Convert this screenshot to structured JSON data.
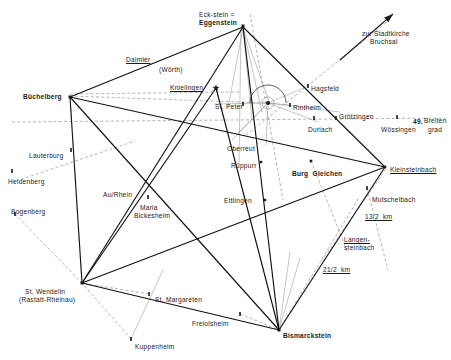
{
  "figure": {
    "kind": "geometric-survey-map",
    "region": "Karlsruhe / Rastatt / Pfinzgau alignment diagram",
    "colors": {
      "ink": "#1a1a1a",
      "heavy_line": "#111111",
      "light_line": "#8a8a8a",
      "dashed_line": "#777777",
      "background": "#ffffff"
    }
  },
  "labels": [
    {
      "id": "eckstein",
      "text": "Eck-stein =",
      "x": 199,
      "y": 11,
      "bold": false,
      "underline": false,
      "align": "left"
    },
    {
      "id": "eggenstein",
      "text": "Eggenstein",
      "x": 199,
      "y": 19,
      "bold": true,
      "underline": false,
      "align": "left"
    },
    {
      "id": "stadtkirche",
      "text": "zur Stadtkirche",
      "x": 362,
      "y": 30,
      "bold": false,
      "underline": false,
      "align": "left"
    },
    {
      "id": "bruchsal",
      "text": "Bruchsal",
      "x": 370,
      "y": 38,
      "bold": false,
      "underline": false,
      "align": "left"
    },
    {
      "id": "daimler",
      "text": "Daimler",
      "x": 126,
      "y": 56,
      "bold": false,
      "underline": true,
      "align": "left"
    },
    {
      "id": "woerth",
      "text": "(Wörth)",
      "x": 159,
      "y": 66,
      "bold": false,
      "underline": false,
      "align": "left"
    },
    {
      "id": "knielingen",
      "text": "Knielingen",
      "x": 170,
      "y": 84,
      "bold": false,
      "underline": true,
      "align": "left"
    },
    {
      "id": "hagsfeld",
      "text": "Hagsfeld",
      "x": 311,
      "y": 85,
      "bold": false,
      "underline": false,
      "align": "left"
    },
    {
      "id": "buechelberg",
      "text": "Büchelberg",
      "x": 23,
      "y": 93,
      "bold": true,
      "underline": false,
      "align": "left"
    },
    {
      "id": "stpeter",
      "text": "St. Peter",
      "x": 215,
      "y": 103,
      "bold": false,
      "underline": false,
      "align": "left"
    },
    {
      "id": "rintheim",
      "text": "Rintheim",
      "x": 293,
      "y": 104,
      "bold": false,
      "underline": false,
      "align": "left"
    },
    {
      "id": "groetzingen",
      "text": "Grötzingen",
      "x": 339,
      "y": 113,
      "bold": false,
      "underline": false,
      "align": "left"
    },
    {
      "id": "breitengrad_num",
      "text": "49.",
      "x": 413,
      "y": 118,
      "bold": true,
      "underline": false,
      "align": "left"
    },
    {
      "id": "breiten",
      "text": "Breiten",
      "x": 424,
      "y": 117,
      "bold": false,
      "underline": false,
      "align": "left"
    },
    {
      "id": "grad",
      "text": "grad",
      "x": 428,
      "y": 126,
      "bold": false,
      "underline": false,
      "align": "left"
    },
    {
      "id": "durlach",
      "text": "Durlach",
      "x": 308,
      "y": 126,
      "bold": false,
      "underline": false,
      "align": "left"
    },
    {
      "id": "woessingen",
      "text": "Wössingen",
      "x": 381,
      "y": 126,
      "bold": false,
      "underline": false,
      "align": "left"
    },
    {
      "id": "lauterburg",
      "text": "Lauterburg",
      "x": 29,
      "y": 152,
      "bold": false,
      "underline": false,
      "align": "left"
    },
    {
      "id": "oberreut",
      "text": "Oberreut",
      "x": 227,
      "y": 145,
      "bold": false,
      "underline": false,
      "align": "left"
    },
    {
      "id": "rueppurr",
      "text": "Rüppurr",
      "x": 231,
      "y": 162,
      "bold": false,
      "underline": false,
      "align": "left"
    },
    {
      "id": "burg_gleichen",
      "text": "Burg  Gleichen",
      "x": 292,
      "y": 170,
      "bold": true,
      "underline": false,
      "align": "left"
    },
    {
      "id": "kleinsteinbach",
      "text": "Kleinsteinbach",
      "x": 390,
      "y": 166,
      "bold": false,
      "underline": true,
      "align": "left"
    },
    {
      "id": "heidenberg",
      "text": "Heidenberg",
      "x": 8,
      "y": 178,
      "bold": false,
      "underline": false,
      "align": "left"
    },
    {
      "id": "au_rhein",
      "text": "Au/Rhein",
      "x": 103,
      "y": 191,
      "bold": false,
      "underline": false,
      "align": "left"
    },
    {
      "id": "mutschelbach",
      "text": "Mutschelbach",
      "x": 372,
      "y": 196,
      "bold": false,
      "underline": false,
      "align": "left"
    },
    {
      "id": "bogenberg",
      "text": "Bogenberg",
      "x": 11,
      "y": 208,
      "bold": false,
      "underline": false,
      "align": "left"
    },
    {
      "id": "maria",
      "text": "Maria",
      "x": 140,
      "y": 204,
      "bold": false,
      "underline": false,
      "align": "left"
    },
    {
      "id": "bickesheim",
      "text": "Bickesheim",
      "x": 134,
      "y": 212,
      "bold": false,
      "underline": false,
      "align": "left"
    },
    {
      "id": "ettlingen",
      "text": "Ettlingen",
      "x": 224,
      "y": 197,
      "bold": false,
      "underline": false,
      "align": "left"
    },
    {
      "id": "km_13_2",
      "text": "13/2  km",
      "x": 365,
      "y": 213,
      "bold": false,
      "underline": true,
      "align": "left"
    },
    {
      "id": "langen",
      "text": "Langen-",
      "x": 344,
      "y": 236,
      "bold": false,
      "underline": true,
      "align": "left"
    },
    {
      "id": "steinbach",
      "text": "steinbach",
      "x": 344,
      "y": 244,
      "bold": false,
      "underline": false,
      "align": "left"
    },
    {
      "id": "km_21_2",
      "text": "21/2  km",
      "x": 323,
      "y": 266,
      "bold": false,
      "underline": true,
      "align": "left"
    },
    {
      "id": "st_wendelin",
      "text": "St. Wendelin",
      "x": 25,
      "y": 288,
      "bold": false,
      "underline": false,
      "align": "left"
    },
    {
      "id": "rastatt",
      "text": "(Rastatt-Rheinau)",
      "x": 19,
      "y": 296,
      "bold": false,
      "underline": false,
      "align": "left"
    },
    {
      "id": "st_margareten",
      "text": "St. Margareten",
      "x": 155,
      "y": 296,
      "bold": false,
      "underline": false,
      "align": "left"
    },
    {
      "id": "freiolsheim",
      "text": "Freiolsheim",
      "x": 192,
      "y": 320,
      "bold": false,
      "underline": false,
      "align": "left"
    },
    {
      "id": "bismarckstein",
      "text": "Bismarckstein",
      "x": 283,
      "y": 332,
      "bold": true,
      "underline": false,
      "align": "left"
    },
    {
      "id": "kuppenheim",
      "text": "Kuppenheim",
      "x": 135,
      "y": 343,
      "bold": false,
      "underline": false,
      "align": "left"
    }
  ],
  "nodes": [
    {
      "id": "eggenstein",
      "name": "Eggenstein (Eck-stein)",
      "x": 243,
      "y": 26,
      "marker": "square",
      "size": 3.0
    },
    {
      "id": "knielingen",
      "name": "Knielingen",
      "x": 216,
      "y": 88,
      "marker": "star",
      "size": 3.6
    },
    {
      "id": "buechelberg",
      "name": "Büchelberg",
      "x": 70,
      "y": 97,
      "marker": "square",
      "size": 3.0
    },
    {
      "id": "hub",
      "name": "Karlsruhe hub",
      "x": 268,
      "y": 103,
      "marker": "circle",
      "size": 2.0
    },
    {
      "id": "stpeter",
      "name": "St. Peter",
      "x": 243,
      "y": 104,
      "marker": "tick",
      "size": 2.0
    },
    {
      "id": "hagsfeld",
      "name": "Hagsfeld",
      "x": 308,
      "y": 86,
      "marker": "tick",
      "size": 2.0
    },
    {
      "id": "rintheim",
      "name": "Rintheim",
      "x": 290,
      "y": 105,
      "marker": "tick",
      "size": 2.0
    },
    {
      "id": "kleinsteinbach",
      "name": "Kleinsteinbach",
      "x": 385,
      "y": 167,
      "marker": "square",
      "size": 2.6
    },
    {
      "id": "burg_gleichen",
      "name": "Burg Gleichen",
      "x": 311,
      "y": 161,
      "marker": "square",
      "size": 2.6
    },
    {
      "id": "rueppurr",
      "name": "Rüppurr",
      "x": 261,
      "y": 162,
      "marker": "square",
      "size": 2.4
    },
    {
      "id": "ettlingen",
      "name": "Ettlingen",
      "x": 265,
      "y": 200,
      "marker": "square",
      "size": 2.4
    },
    {
      "id": "st_wendelin",
      "name": "St. Wendelin",
      "x": 82,
      "y": 283,
      "marker": "square",
      "size": 3.0
    },
    {
      "id": "bismarckstein",
      "name": "Bismarckstein",
      "x": 279,
      "y": 330,
      "marker": "square",
      "size": 3.0
    },
    {
      "id": "lauterburg",
      "name": "Lauterburg",
      "x": 71,
      "y": 150,
      "marker": "tick",
      "size": 2.0
    },
    {
      "id": "heidenberg",
      "name": "Heidenberg",
      "x": 12,
      "y": 171,
      "marker": "tick",
      "size": 2.0
    },
    {
      "id": "bogenberg",
      "name": "Bogenberg",
      "x": 15,
      "y": 214,
      "marker": "tick",
      "size": 2.0
    },
    {
      "id": "maria",
      "name": "Maria Bickesheim",
      "x": 148,
      "y": 197,
      "marker": "tick",
      "size": 2.0
    },
    {
      "id": "mutschelbach",
      "name": "Mutschelbach",
      "x": 367,
      "y": 188,
      "marker": "tick",
      "size": 2.0
    },
    {
      "id": "st_margareten",
      "name": "St. Margareten",
      "x": 149,
      "y": 294,
      "marker": "tick",
      "size": 2.0
    },
    {
      "id": "kuppenheim",
      "name": "Kuppenheim",
      "x": 131,
      "y": 339,
      "marker": "tick",
      "size": 2.0
    },
    {
      "id": "freiolsheim",
      "name": "Freiolsheim",
      "x": 240,
      "y": 314,
      "marker": "tick",
      "size": 2.0
    },
    {
      "id": "woessingen",
      "name": "Wössingen",
      "x": 397,
      "y": 117,
      "marker": "tick",
      "size": 2.0
    },
    {
      "id": "durlach",
      "name": "Durlach",
      "x": 314,
      "y": 118,
      "marker": "tick",
      "size": 2.0
    },
    {
      "id": "groetzingen",
      "name": "Grötzingen",
      "x": 336,
      "y": 118,
      "marker": "tick",
      "size": 2.0
    }
  ],
  "heavy_lines": [
    {
      "id": "eggenstein-buechelberg",
      "x1": 243,
      "y1": 27,
      "x2": 70,
      "y2": 97
    },
    {
      "id": "eggenstein-bismarck",
      "x1": 243,
      "y1": 27,
      "x2": 279,
      "y2": 330
    },
    {
      "id": "eggenstein-stwendelin",
      "x1": 243,
      "y1": 27,
      "x2": 82,
      "y2": 283
    },
    {
      "id": "eggenstein-kleinstein",
      "x1": 243,
      "y1": 27,
      "x2": 385,
      "y2": 167
    },
    {
      "id": "buechelberg-kleinstein",
      "x1": 70,
      "y1": 97,
      "x2": 385,
      "y2": 167
    },
    {
      "id": "buechelberg-bismarck",
      "x1": 70,
      "y1": 97,
      "x2": 279,
      "y2": 330
    },
    {
      "id": "buechelberg-stwendelin",
      "x1": 70,
      "y1": 97,
      "x2": 82,
      "y2": 283
    },
    {
      "id": "stwendelin-kleinstein",
      "x1": 82,
      "y1": 283,
      "x2": 385,
      "y2": 167
    },
    {
      "id": "stwendelin-bismarck",
      "x1": 82,
      "y1": 283,
      "x2": 279,
      "y2": 330
    },
    {
      "id": "bismarck-kleinstein",
      "x1": 279,
      "y1": 330,
      "x2": 385,
      "y2": 167
    },
    {
      "id": "stwendelin-knielingen",
      "x1": 82,
      "y1": 283,
      "x2": 216,
      "y2": 88
    },
    {
      "id": "knielingen-bismarck",
      "x1": 216,
      "y1": 88,
      "x2": 279,
      "y2": 330
    }
  ],
  "thin_lines": [
    {
      "id": "egg-fan-1",
      "x1": 243,
      "y1": 28,
      "x2": 228,
      "y2": 108
    },
    {
      "id": "egg-fan-2",
      "x1": 243,
      "y1": 28,
      "x2": 252,
      "y2": 120
    },
    {
      "id": "egg-fan-3",
      "x1": 243,
      "y1": 28,
      "x2": 262,
      "y2": 112
    },
    {
      "id": "egg-fan-4",
      "x1": 243,
      "y1": 28,
      "x2": 270,
      "y2": 104
    },
    {
      "id": "egg-vert",
      "x1": 241,
      "y1": 28,
      "x2": 239,
      "y2": 164
    },
    {
      "id": "hub-hag",
      "x1": 268,
      "y1": 103,
      "x2": 308,
      "y2": 86
    },
    {
      "id": "hub-rint",
      "x1": 268,
      "y1": 103,
      "x2": 290,
      "y2": 105
    },
    {
      "id": "hub-groetz",
      "x1": 268,
      "y1": 103,
      "x2": 340,
      "y2": 112
    },
    {
      "id": "hub-durl",
      "x1": 268,
      "y1": 103,
      "x2": 318,
      "y2": 122
    },
    {
      "id": "hub-stp",
      "x1": 268,
      "y1": 103,
      "x2": 214,
      "y2": 104
    },
    {
      "id": "hub-obr",
      "x1": 268,
      "y1": 103,
      "x2": 232,
      "y2": 140
    },
    {
      "id": "hub-down",
      "x1": 268,
      "y1": 103,
      "x2": 266,
      "y2": 145
    },
    {
      "id": "hub-sw",
      "x1": 268,
      "y1": 103,
      "x2": 238,
      "y2": 133
    },
    {
      "id": "kuppen-up",
      "x1": 131,
      "y1": 339,
      "x2": 163,
      "y2": 270
    },
    {
      "id": "bism-fan1",
      "x1": 279,
      "y1": 330,
      "x2": 290,
      "y2": 252
    },
    {
      "id": "bism-fan2",
      "x1": 279,
      "y1": 330,
      "x2": 300,
      "y2": 258
    }
  ],
  "dashed_lines": [
    {
      "id": "latitude-49",
      "x1": 12,
      "y1": 122,
      "x2": 445,
      "y2": 118
    },
    {
      "id": "buechel-dash",
      "x1": 70,
      "y1": 96,
      "x2": 268,
      "y2": 103
    },
    {
      "id": "buechel-dash2",
      "x1": 70,
      "y1": 94,
      "x2": 240,
      "y2": 92
    },
    {
      "id": "bruchsal-ray",
      "x1": 246,
      "y1": 135,
      "x2": 392,
      "y2": 18
    },
    {
      "id": "eggen-dash-dn",
      "x1": 250,
      "y1": 14,
      "x2": 283,
      "y2": 200
    },
    {
      "id": "lauterburg-r",
      "x1": 16,
      "y1": 181,
      "x2": 135,
      "y2": 141
    },
    {
      "id": "bogenberg-r",
      "x1": 15,
      "y1": 214,
      "x2": 82,
      "y2": 283
    },
    {
      "id": "margareten-r",
      "x1": 149,
      "y1": 294,
      "x2": 82,
      "y2": 283
    },
    {
      "id": "kuppen-dash",
      "x1": 131,
      "y1": 339,
      "x2": 82,
      "y2": 283
    },
    {
      "id": "mutschel-dash",
      "x1": 367,
      "y1": 188,
      "x2": 388,
      "y2": 270
    },
    {
      "id": "langen-cross1",
      "x1": 311,
      "y1": 161,
      "x2": 348,
      "y2": 253
    },
    {
      "id": "langen-cross2",
      "x1": 386,
      "y1": 169,
      "x2": 321,
      "y2": 262
    },
    {
      "id": "bism-21km",
      "x1": 279,
      "y1": 330,
      "x2": 360,
      "y2": 196
    },
    {
      "id": "freiol-dash",
      "x1": 240,
      "y1": 314,
      "x2": 279,
      "y2": 330
    }
  ],
  "arrows": [
    {
      "id": "bruchsal-arrow",
      "x1": 340,
      "y1": 60,
      "x2": 393,
      "y2": 14
    }
  ],
  "arc": {
    "id": "protractor-arc",
    "cx": 268,
    "cy": 103,
    "r": 18,
    "start": 180,
    "end": 360
  }
}
